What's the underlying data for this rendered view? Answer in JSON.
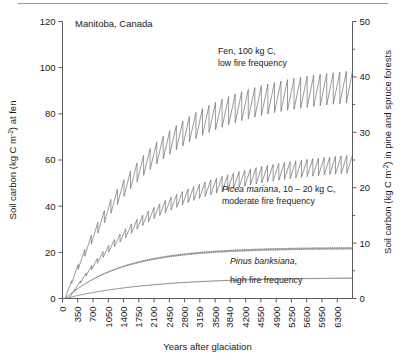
{
  "figure": {
    "title": "Manitoba, Canada",
    "top_rule": true
  },
  "axes": {
    "left": {
      "label_main": "Soil carbon (kg C m",
      "label_sup": "-2",
      "label_tail": ") at fen",
      "ticks": [
        "0",
        "20",
        "40",
        "60",
        "80",
        "100",
        "120"
      ],
      "min": 0,
      "max": 120
    },
    "right": {
      "label_main": "Soil carbon (kg C m",
      "label_sup": "-2",
      "label_tail": ") in pine and spruce forests",
      "ticks": [
        "0",
        "10",
        "20",
        "30",
        "40",
        "50"
      ],
      "minor_ticks": [
        "5",
        "15",
        "25",
        "35",
        "45"
      ],
      "min": 0,
      "max": 50
    },
    "x": {
      "label": "Years after glaciation",
      "ticks": [
        "0",
        "350",
        "700",
        "1050",
        "1400",
        "1750",
        "2100",
        "2450",
        "2800",
        "3150",
        "3500",
        "3840",
        "4200",
        "4550",
        "4900",
        "5250",
        "5600",
        "5950",
        "6300"
      ],
      "min": 0,
      "max": 6650
    }
  },
  "annotations": {
    "fen_line1": "Fen, 100 kg C,",
    "fen_line2": "low fire frequency",
    "picea_italic": "Picea mariana",
    "picea_rest": ", 10 – 20 kg C,",
    "picea_line2": "moderate fire frequency",
    "pinus_italic": "Pinus banksiana",
    "pinus_rest": ",",
    "pinus_line2": "high fire frequency"
  },
  "colors": {
    "curve": "#6e6e6e",
    "axis": "#5a5a5a",
    "text": "#1a1a1a",
    "background": "#ffffff"
  },
  "chart_data": {
    "type": "line",
    "title": "Manitoba, Canada",
    "xlabel": "Years after glaciation",
    "ylabel": "Soil carbon (kg C m-2) at fen",
    "ylabel_right": "Soil carbon (kg C m-2) in pine and spruce forests",
    "xlim": [
      0,
      6650
    ],
    "ylim": [
      0,
      120
    ],
    "ylim_right": [
      0,
      50
    ],
    "grid": false,
    "legend": "annotations-inline",
    "series": [
      {
        "name": "Fen, 100 kg C, low fire frequency",
        "axis": "left",
        "fire_return_interval_years": 150,
        "asymptote": 100,
        "equilibrium_range": [
          85,
          103
        ],
        "x": [
          0,
          350,
          700,
          1050,
          1400,
          1750,
          2100,
          2450,
          2800,
          3150,
          3500,
          3840,
          4200,
          4550,
          4900,
          5250,
          5600,
          5950,
          6300,
          6650
        ],
        "values_peak": [
          0,
          13,
          26,
          38,
          48,
          57,
          65,
          71,
          77,
          82,
          86,
          89,
          92,
          94,
          96,
          98,
          99,
          100,
          101,
          102
        ],
        "values_trough": [
          0,
          6,
          15,
          25,
          34,
          42,
          50,
          56,
          62,
          67,
          71,
          75,
          78,
          80,
          82,
          84,
          85,
          86,
          87,
          88
        ]
      },
      {
        "name": "Picea mariana, 10 - 20 kg C, moderate fire frequency",
        "axis": "right",
        "fire_return_interval_years": 130,
        "asymptote_right_axis": 26,
        "equilibrium_range_right": [
          22,
          26
        ],
        "x": [
          0,
          350,
          700,
          1050,
          1400,
          1750,
          2100,
          2450,
          2800,
          3150,
          3500,
          3840,
          4200,
          4550,
          4900,
          5250,
          5600,
          5950,
          6300,
          6650
        ],
        "values_peak_left_scale": [
          0,
          6,
          14,
          23,
          31,
          38,
          44,
          49,
          53,
          56,
          58,
          60,
          61,
          62,
          63,
          63,
          64,
          64,
          65,
          65
        ],
        "values_trough_left_scale": [
          0,
          3,
          8,
          15,
          22,
          29,
          35,
          40,
          44,
          47,
          50,
          52,
          53,
          54,
          55,
          55,
          56,
          56,
          57,
          57
        ]
      },
      {
        "name": "Upper dense sawtooth (spruce/pine mid curve)",
        "axis": "right",
        "fire_return_interval_years": 40,
        "asymptote_right_axis": 9,
        "x": [
          0,
          350,
          700,
          1050,
          1400,
          1750,
          2100,
          2450,
          2800,
          3150,
          3500,
          3840,
          4200,
          4550,
          4900,
          5250,
          5600,
          5950,
          6300,
          6650
        ],
        "values_left_scale": [
          0,
          4,
          7.5,
          10.5,
          13,
          15,
          16.6,
          17.9,
          19,
          19.8,
          20.4,
          20.9,
          21.2,
          21.5,
          21.7,
          21.9,
          22,
          22.1,
          22.2,
          22.3
        ]
      },
      {
        "name": "Pinus banksiana, high fire frequency",
        "axis": "right",
        "fire_return_interval_years": 30,
        "asymptote_right_axis": 4,
        "x": [
          0,
          350,
          700,
          1050,
          1400,
          1750,
          2100,
          2450,
          2800,
          3150,
          3500,
          3840,
          4200,
          4550,
          4900,
          5250,
          5600,
          5950,
          6300,
          6650
        ],
        "values_left_scale": [
          0,
          1.2,
          2.3,
          3.3,
          4.2,
          5.0,
          5.7,
          6.3,
          6.8,
          7.2,
          7.6,
          7.9,
          8.2,
          8.4,
          8.6,
          8.75,
          8.9,
          9.0,
          9.1,
          9.2
        ]
      }
    ]
  }
}
